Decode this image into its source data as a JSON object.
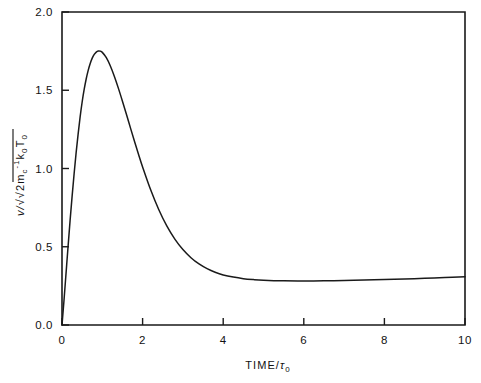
{
  "figure": {
    "background_color": "#ffffff",
    "line_color": "#1a1a1a",
    "text_color": "#121212"
  },
  "axes": {
    "x_title_main": "TIME/",
    "x_title_tau": "τ",
    "x_title_tau_sub": "0",
    "y_title_v": "v/",
    "y_title_radical": "√",
    "y_title_two_m": "2m",
    "y_title_m_sub": "c",
    "y_title_m_sup": "-1",
    "y_title_k": "k",
    "y_title_k_sub": "0",
    "y_title_T": "T",
    "y_title_T_sub": "0",
    "x_ticklabels": [
      "0",
      "2",
      "4",
      "6",
      "8",
      "10"
    ],
    "y_ticklabels": [
      "0.0",
      "0.5",
      "1.0",
      "1.5",
      "2.0"
    ]
  },
  "chart_data": {
    "type": "line",
    "title": "",
    "subtitle": "",
    "xlabel": "TIME/τ₀",
    "ylabel": "v/√(2m_c^-1 k₀T₀)",
    "xlim": [
      0,
      10
    ],
    "ylim": [
      0.0,
      2.0
    ],
    "xticks": [
      0,
      2,
      4,
      6,
      8,
      10
    ],
    "yticks": [
      0.0,
      0.5,
      1.0,
      1.5,
      2.0
    ],
    "grid": false,
    "legend": null,
    "legend_position": "none",
    "series": [
      {
        "name": "velocity response",
        "x": [
          0.0,
          0.05,
          0.1,
          0.15,
          0.2,
          0.25,
          0.3,
          0.35,
          0.4,
          0.45,
          0.5,
          0.55,
          0.6,
          0.65,
          0.7,
          0.75,
          0.8,
          0.85,
          0.9,
          0.95,
          1.0,
          1.1,
          1.2,
          1.3,
          1.4,
          1.5,
          1.6,
          1.7,
          1.8,
          1.9,
          2.0,
          2.2,
          2.4,
          2.6,
          2.8,
          3.0,
          3.2,
          3.4,
          3.6,
          3.8,
          4.0,
          4.25,
          4.5,
          4.75,
          5.0,
          5.5,
          6.0,
          6.5,
          7.0,
          7.5,
          8.0,
          8.5,
          9.0,
          9.5,
          10.0
        ],
        "y": [
          0.0,
          0.16,
          0.33,
          0.5,
          0.665,
          0.82,
          0.965,
          1.1,
          1.22,
          1.33,
          1.425,
          1.505,
          1.572,
          1.627,
          1.671,
          1.705,
          1.729,
          1.744,
          1.751,
          1.75,
          1.742,
          1.708,
          1.655,
          1.588,
          1.512,
          1.43,
          1.345,
          1.258,
          1.173,
          1.09,
          1.01,
          0.864,
          0.738,
          0.633,
          0.549,
          0.482,
          0.43,
          0.39,
          0.36,
          0.337,
          0.32,
          0.306,
          0.296,
          0.29,
          0.286,
          0.282,
          0.281,
          0.282,
          0.284,
          0.287,
          0.29,
          0.294,
          0.298,
          0.303,
          0.308
        ]
      }
    ],
    "annotations": [
      {
        "label": "peak",
        "x": 0.9,
        "y": 1.75
      },
      {
        "label": "plateau",
        "x": 6.0,
        "y": 0.281
      }
    ]
  }
}
